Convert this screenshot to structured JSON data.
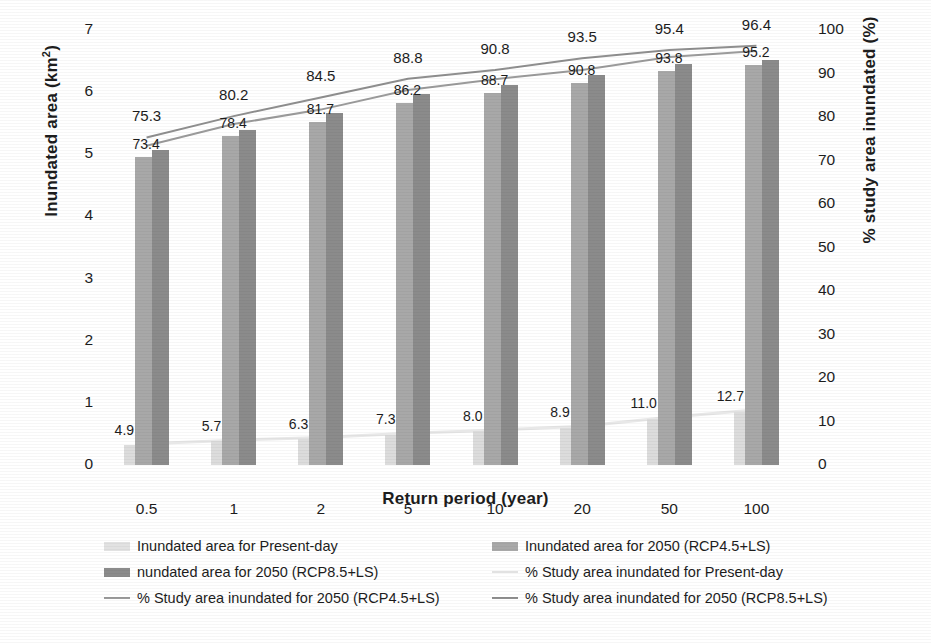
{
  "chart_data": {
    "type": "bar",
    "title": "",
    "xlabel": "Return period (year)",
    "ylabel": "Inundated area (km²)",
    "ylabel_right": "% study area inundated (%)",
    "categories": [
      "0.5",
      "1",
      "2",
      "5",
      "10",
      "20",
      "50",
      "100"
    ],
    "ylim": [
      0,
      7
    ],
    "ylim_right": [
      0,
      100
    ],
    "yticks": [
      "7",
      "6",
      "5",
      "4",
      "3",
      "2",
      "1",
      "0"
    ],
    "yticks_right": [
      "100",
      "90",
      "80",
      "70",
      "60",
      "50",
      "40",
      "30",
      "20",
      "10",
      "0"
    ],
    "grid": false,
    "legend_position": "bottom",
    "series": [
      {
        "name": "Inundated area for Present-day",
        "kind": "bar",
        "axis": "left",
        "color": "#dcdcdc",
        "values": [
          0.33,
          0.38,
          0.42,
          0.49,
          0.54,
          0.6,
          0.74,
          0.86
        ],
        "labels": [
          "",
          "",
          "",
          "",
          "",
          "",
          "",
          ""
        ]
      },
      {
        "name": "Inundated area for 2050 (RCP4.5+LS)",
        "kind": "bar",
        "axis": "left",
        "color": "#a8a8a8",
        "values": [
          4.9,
          5.7,
          6.3,
          7.3,
          8.0,
          8.9,
          11.0,
          12.7
        ],
        "values_km2": [
          4.96,
          5.3,
          5.52,
          5.83,
          5.99,
          6.14,
          6.34,
          6.44
        ],
        "labels": [
          "4.9",
          "5.7",
          "6.3",
          "7.3",
          "8.0",
          "8.9",
          "11.0",
          "12.7"
        ]
      },
      {
        "name": "nundated area for 2050 (RCP8.5+LS)",
        "kind": "bar",
        "axis": "left",
        "color": "#8b8b8b",
        "values_km2": [
          5.07,
          5.39,
          5.66,
          5.97,
          6.12,
          6.28,
          6.45,
          6.52
        ],
        "labels": [
          "",
          "",
          "",
          "",
          "",
          "",
          "",
          ""
        ]
      },
      {
        "name": "% Study area inundated for Present-day",
        "kind": "line",
        "axis": "right",
        "color": "#e8e8e8",
        "values": [
          4.9,
          5.7,
          6.3,
          7.3,
          8.0,
          8.9,
          11.0,
          12.7
        ],
        "labels": [
          "4.9",
          "5.7",
          "6.3",
          "7.3",
          "8.0",
          "8.9",
          "11.0",
          "12.7"
        ]
      },
      {
        "name": "% Study area inundated for 2050 (RCP4.5+LS)",
        "kind": "line",
        "axis": "right",
        "color": "#9b9b9b",
        "values": [
          73.4,
          78.4,
          81.7,
          86.2,
          88.7,
          90.8,
          93.8,
          95.2
        ],
        "labels": [
          "73.4",
          "78.4",
          "81.7",
          "86.2",
          "88.7",
          "90.8",
          "93.8",
          "95.2"
        ]
      },
      {
        "name": "% Study area inundated for 2050 (RCP8.5+LS)",
        "kind": "line",
        "axis": "right",
        "color": "#8f8f8f",
        "values": [
          75.3,
          80.2,
          84.5,
          88.8,
          90.8,
          93.5,
          95.4,
          96.4
        ],
        "labels": [
          "75.3",
          "80.2",
          "84.5",
          "88.8",
          "90.8",
          "93.5",
          "95.4",
          "96.4"
        ]
      }
    ]
  },
  "legend": {
    "left_column": [
      {
        "label": "Inundated area for Present-day",
        "swatch": "bar",
        "color": "#e2e2e2"
      },
      {
        "label": "nundated area for 2050 (RCP8.5+LS)",
        "swatch": "bar",
        "color": "#8b8b8b"
      },
      {
        "label": "% Study area inundated for 2050 (RCP4.5+LS)",
        "swatch": "line",
        "color": "#9b9b9b"
      }
    ],
    "right_column": [
      {
        "label": "Inundated area for 2050 (RCP4.5+LS)",
        "swatch": "bar",
        "color": "#a8a8a8"
      },
      {
        "label": "% Study area inundated for Present-day",
        "swatch": "line",
        "color": "#e2e2e2"
      },
      {
        "label": "% Study area inundated for 2050 (RCP8.5+LS)",
        "swatch": "line",
        "color": "#8f8f8f"
      }
    ]
  }
}
